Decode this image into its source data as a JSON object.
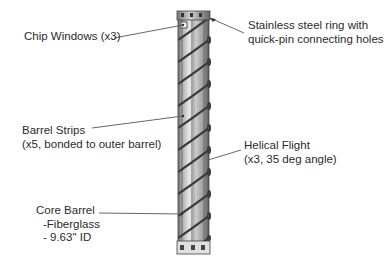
{
  "figure": {
    "labels": {
      "chip_windows": {
        "lines": [
          "Chip Windows (x3)"
        ]
      },
      "stainless_ring": {
        "lines": [
          "Stainless steel ring with",
          "quick-pin connecting holes"
        ]
      },
      "barrel_strips": {
        "lines": [
          "Barrel Strips",
          "(x5, bonded to outer barrel)"
        ]
      },
      "helical_flight": {
        "lines": [
          "Helical Flight",
          "(x3, 35 deg angle)"
        ]
      },
      "core_barrel": {
        "lines": [
          "Core Barrel",
          "-Fiberglass",
          "- 9.63\" ID"
        ]
      }
    },
    "colors": {
      "background": "#ffffff",
      "text": "#2b2b2b",
      "leader_line": "#555555",
      "barrel_light": "#d8d8d8",
      "barrel_mid": "#a8a8a8",
      "barrel_dark": "#4a4a4a",
      "flight": "#3a3a3a"
    }
  }
}
